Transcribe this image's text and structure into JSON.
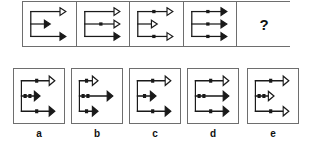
{
  "puzzle": {
    "type": "visual-analogy-matrix",
    "prompt_symbol": "?",
    "stroke_color": "#1a1a1a",
    "box_border_color": "#6e6e6e",
    "background": "#ffffff",
    "sequence": [
      {
        "id": "seq-1",
        "arrows": [
          {
            "row": "top",
            "length": "long",
            "head": "hollow",
            "dots": 0
          },
          {
            "row": "middle",
            "length": "short",
            "head": "solid",
            "dots": 0
          },
          {
            "row": "bottom",
            "length": "long",
            "head": "solid",
            "dots": 0
          }
        ]
      },
      {
        "id": "seq-2",
        "arrows": [
          {
            "row": "top",
            "length": "long",
            "head": "hollow",
            "dots": 0
          },
          {
            "row": "middle",
            "length": "long",
            "head": "hollow",
            "dots": 1
          },
          {
            "row": "bottom",
            "length": "long",
            "head": "solid",
            "dots": 0
          }
        ]
      },
      {
        "id": "seq-3",
        "arrows": [
          {
            "row": "top",
            "length": "long",
            "head": "hollow",
            "dots": 1
          },
          {
            "row": "middle",
            "length": "short",
            "head": "hollow",
            "dots": 0
          },
          {
            "row": "bottom",
            "length": "long",
            "head": "hollow",
            "dots": 1
          }
        ]
      },
      {
        "id": "seq-4",
        "arrows": [
          {
            "row": "top",
            "length": "long",
            "head": "solid",
            "dots": 1
          },
          {
            "row": "middle",
            "length": "long",
            "head": "solid",
            "dots": 1
          },
          {
            "row": "bottom",
            "length": "long",
            "head": "solid",
            "dots": 1
          }
        ]
      },
      {
        "id": "seq-5-unknown",
        "arrows": []
      }
    ],
    "options": [
      {
        "label": "a",
        "arrows": [
          {
            "row": "top",
            "length": "long",
            "head": "hollow",
            "dots": 1
          },
          {
            "row": "middle",
            "length": "short",
            "head": "solid",
            "dots": 2
          },
          {
            "row": "bottom",
            "length": "long",
            "head": "solid",
            "dots": 1
          }
        ]
      },
      {
        "label": "b",
        "arrows": [
          {
            "row": "top",
            "length": "short",
            "head": "hollow",
            "dots": 1
          },
          {
            "row": "middle",
            "length": "long",
            "head": "solid",
            "dots": 2
          },
          {
            "row": "bottom",
            "length": "short",
            "head": "solid",
            "dots": 1
          }
        ]
      },
      {
        "label": "c",
        "arrows": [
          {
            "row": "top",
            "length": "long",
            "head": "hollow",
            "dots": 1
          },
          {
            "row": "middle",
            "length": "short",
            "head": "solid",
            "dots": 1
          },
          {
            "row": "bottom",
            "length": "long",
            "head": "solid",
            "dots": 1
          }
        ]
      },
      {
        "label": "d",
        "arrows": [
          {
            "row": "top",
            "length": "long",
            "head": "hollow",
            "dots": 1
          },
          {
            "row": "middle",
            "length": "long",
            "head": "solid",
            "dots": 2
          },
          {
            "row": "bottom",
            "length": "long",
            "head": "solid",
            "dots": 1
          }
        ]
      },
      {
        "label": "e",
        "arrows": [
          {
            "row": "top",
            "length": "long",
            "head": "hollow",
            "dots": 1
          },
          {
            "row": "middle",
            "length": "short",
            "head": "hollow",
            "dots": 2
          },
          {
            "row": "bottom",
            "length": "long",
            "head": "hollow",
            "dots": 1
          }
        ]
      }
    ]
  }
}
